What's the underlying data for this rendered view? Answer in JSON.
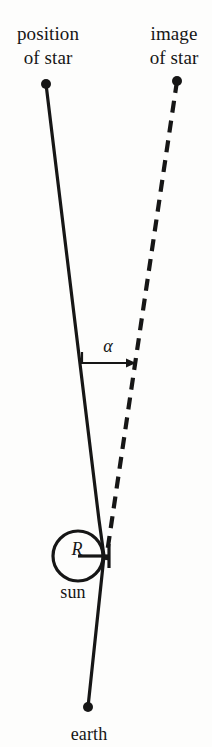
{
  "figure": {
    "background_color": "#fdfdfc",
    "ink_color": "#161616"
  },
  "labels": {
    "position_of_star_line1": "position",
    "position_of_star_line2": "of star",
    "image_of_star_line1": "image",
    "image_of_star_line2": "of star",
    "sun": "sun",
    "earth": "earth",
    "alpha": "α",
    "radius": "R"
  },
  "geometry": {
    "star_dot": {
      "x": 46,
      "y": 84,
      "r": 5
    },
    "image_dot": {
      "x": 177,
      "y": 81,
      "r": 5
    },
    "earth_dot": {
      "x": 88,
      "y": 707,
      "r": 5
    },
    "solid_ray": {
      "style": "solid",
      "stroke_width": 3.2,
      "points": [
        [
          46,
          84
        ],
        [
          99,
          520
        ],
        [
          104,
          556
        ],
        [
          88,
          707
        ]
      ]
    },
    "dashed_ray": {
      "style": "dashed",
      "stroke_width": 4.2,
      "dash": "12 8",
      "points": [
        [
          177,
          81
        ],
        [
          106,
          560
        ]
      ]
    },
    "sun_circle": {
      "cx": 78,
      "cy": 556,
      "r": 25,
      "stroke_width": 3.2
    },
    "radius_line": {
      "x1": 78,
      "y1": 556,
      "x2": 109,
      "y2": 556,
      "stroke_width": 3.2
    },
    "radius_tick": {
      "x": 109,
      "y1": 544,
      "y2": 568,
      "stroke_width": 3.2
    },
    "alpha_arrow": {
      "x1": 82,
      "y1": 363,
      "x2": 133,
      "y2": 363,
      "stem_top_y": 352,
      "stroke_width": 2.2,
      "arrowhead": "right"
    }
  }
}
